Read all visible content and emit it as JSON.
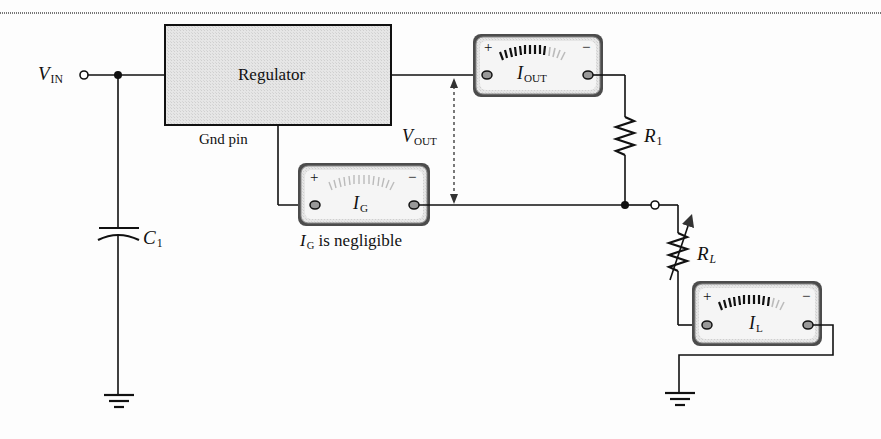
{
  "figure": {
    "type": "circuit-schematic"
  },
  "regulator": {
    "label": "Regulator",
    "gnd_pin_label": "Gnd pin"
  },
  "input": {
    "symbol": "V",
    "subscript": "IN"
  },
  "output_voltage": {
    "symbol": "V",
    "subscript": "OUT"
  },
  "capacitor": {
    "symbol": "C",
    "subscript": "1"
  },
  "resistor_r1": {
    "symbol": "R",
    "subscript": "1"
  },
  "resistor_rl": {
    "symbol": "R",
    "subscript": "L"
  },
  "meters": {
    "i_out": {
      "symbol": "I",
      "subscript": "OUT",
      "plus": "+",
      "minus": "−"
    },
    "i_g": {
      "symbol": "I",
      "subscript": "G",
      "plus": "+",
      "minus": "−",
      "note": "is negligible"
    },
    "i_l": {
      "symbol": "I",
      "subscript": "L",
      "plus": "+",
      "minus": "−"
    }
  },
  "colors": {
    "wire": "#1a1a1a",
    "regulator_fill": "#e3e3e3",
    "meter_bezel": "#5a5a5a",
    "meter_face": "#f4f4f4",
    "dashed_arrow": "#333333"
  }
}
